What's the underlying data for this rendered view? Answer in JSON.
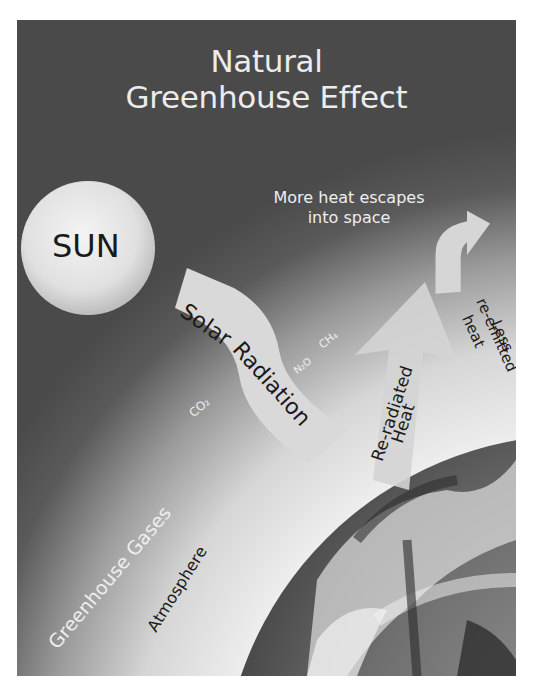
{
  "title": {
    "line1": "Natural",
    "line2": "Greenhouse Effect"
  },
  "sun": {
    "label": "SUN"
  },
  "arrows": {
    "solar_radiation": {
      "line1": "Solar",
      "line2": "Radiation"
    },
    "escape": {
      "line1": "More heat escapes",
      "line2": "into space"
    },
    "reradiated": {
      "line1": "Re-radiated",
      "line2": "Heat"
    },
    "less_reemitted": {
      "line1": "Less",
      "line2": "re-emitted",
      "line3": "heat"
    }
  },
  "gases": {
    "co2": "CO₂",
    "n2o": "N₂O",
    "ch4": "CH₄"
  },
  "layers": {
    "greenhouse_gases": "Greenhouse Gases",
    "atmosphere": "Atmosphere"
  },
  "colors": {
    "space": "#4a4a4a",
    "sun": "#e6e6e6",
    "arrow": "#d9d9d9",
    "atmosphere_light": "#dcdcdc",
    "earth_dark": "#3a3a3a"
  }
}
